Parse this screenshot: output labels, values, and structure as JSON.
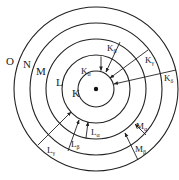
{
  "diagram": {
    "nucleus": {
      "cx": 96,
      "cy": 89,
      "r": 2
    },
    "shells": [
      {
        "name": "K",
        "r": 18,
        "label_x": 72,
        "label_y": 97
      },
      {
        "name": "L",
        "r": 34,
        "label_x": 56,
        "label_y": 86
      },
      {
        "name": "M",
        "r": 50,
        "label_x": 36,
        "label_y": 75
      },
      {
        "name": "N",
        "r": 66,
        "label_x": 23,
        "label_y": 68
      },
      {
        "name": "O",
        "r": 82,
        "label_x": 6,
        "label_y": 65
      }
    ],
    "transitions": [
      {
        "main": "K",
        "sub": "α",
        "label_x": 81,
        "label_y": 74
      },
      {
        "main": "K",
        "sub": "β",
        "label_x": 107,
        "label_y": 51
      },
      {
        "main": "K",
        "sub": "γ",
        "label_x": 145,
        "label_y": 63
      },
      {
        "main": "K",
        "sub": "δ",
        "label_x": 164,
        "label_y": 81
      },
      {
        "main": "L",
        "sub": "α",
        "label_x": 91,
        "label_y": 135
      },
      {
        "main": "L",
        "sub": "β",
        "label_x": 71,
        "label_y": 147
      },
      {
        "main": "L",
        "sub": "γ",
        "label_x": 47,
        "label_y": 153
      },
      {
        "main": "M",
        "sub": "α",
        "label_x": 136,
        "label_y": 129
      },
      {
        "main": "M",
        "sub": "β",
        "label_x": 135,
        "label_y": 152
      }
    ]
  }
}
